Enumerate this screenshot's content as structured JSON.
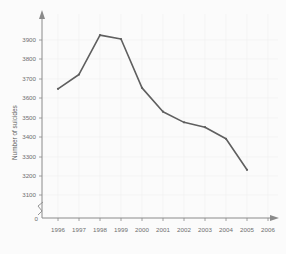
{
  "chart_data": {
    "type": "line",
    "title": "",
    "title_partial": "",
    "xlabel": "",
    "ylabel": "Number of suicides",
    "x": [
      1996,
      1997,
      1998,
      1999,
      2000,
      2001,
      2002,
      2003,
      2004,
      2005
    ],
    "values": [
      3648,
      3722,
      3925,
      3905,
      3653,
      3530,
      3475,
      3450,
      3390,
      3230
    ],
    "series": [
      {
        "name": "Number of suicides",
        "values": [
          3648,
          3722,
          3925,
          3905,
          3653,
          3530,
          3475,
          3450,
          3390,
          3230
        ]
      }
    ],
    "xtick_labels": [
      "1996",
      "1997",
      "1998",
      "1999",
      "2000",
      "2001",
      "2002",
      "2003",
      "2004",
      "2005",
      "2006"
    ],
    "ytick_labels": [
      "0",
      "3100",
      "3200",
      "3300",
      "3400",
      "3500",
      "3600",
      "3700",
      "3800",
      "3900"
    ],
    "ytick_values": [
      3100,
      3200,
      3300,
      3400,
      3500,
      3600,
      3700,
      3800,
      3900
    ],
    "ylim": [
      3100,
      3980
    ],
    "xlim": [
      1995.4,
      2006.6
    ],
    "y_axis_break": true,
    "y_origin_label": "0",
    "grid": true,
    "legend": "none",
    "markers": true,
    "line_color": "#5f5f5f",
    "grid_color": "#f0f0f0",
    "axis_color": "#8a8a8a",
    "background_color": "#fbfbfb"
  }
}
